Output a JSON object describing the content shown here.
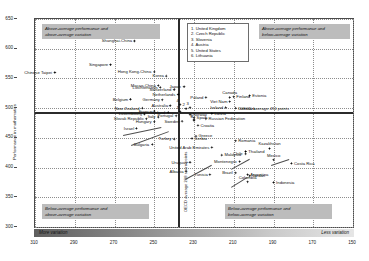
{
  "chart_data": {
    "type": "scatter",
    "title": "",
    "xlabel": "",
    "ylabel": "Performance in mathematics",
    "xlim": [
      310,
      150
    ],
    "ylim": [
      300,
      650
    ],
    "xticks": [
      310,
      290,
      270,
      250,
      230,
      210,
      190,
      170,
      150
    ],
    "yticks": [
      300,
      350,
      400,
      450,
      500,
      550,
      600,
      650
    ],
    "grid": true,
    "x_axis_reversed": true,
    "oecd_average_x": 238,
    "oecd_average_y": 494,
    "points": [
      {
        "label": "Shanghai-China",
        "x": 260,
        "y": 613
      },
      {
        "label": "Singapore",
        "x": 272,
        "y": 573
      },
      {
        "label": "Chinese Taipei",
        "x": 300,
        "y": 560
      },
      {
        "label": "Hong Kong-China",
        "x": 250,
        "y": 561
      },
      {
        "label": "Japan",
        "x": 235,
        "y": 536
      },
      {
        "label": "Macao-China",
        "x": 248,
        "y": 538
      },
      {
        "label": "Korea",
        "x": 244,
        "y": 554
      },
      {
        "label": "Switzerland",
        "x": 240,
        "y": 531
      },
      {
        "label": "Liechtenstein",
        "x": 247,
        "y": 535
      },
      {
        "label": "Netherlands",
        "x": 238,
        "y": 523
      },
      {
        "label": "Belgium",
        "x": 262,
        "y": 515
      },
      {
        "label": "Germany",
        "x": 246,
        "y": 514
      },
      {
        "label": "Australia",
        "x": 242,
        "y": 504
      },
      {
        "label": "New Zealand",
        "x": 256,
        "y": 500
      },
      {
        "label": "Poland",
        "x": 224,
        "y": 518
      },
      {
        "label": "Canada",
        "x": 212,
        "y": 518
      },
      {
        "label": "Viet Nam",
        "x": 212,
        "y": 511
      },
      {
        "label": "Finland",
        "x": 210,
        "y": 519
      },
      {
        "label": "Estonia",
        "x": 202,
        "y": 521
      },
      {
        "label": "Ireland",
        "x": 214,
        "y": 501
      },
      {
        "label": "Denmark",
        "x": 209,
        "y": 500
      },
      {
        "label": "France",
        "x": 250,
        "y": 495
      },
      {
        "label": "Slovak Republic",
        "x": 254,
        "y": 482
      },
      {
        "label": "Israel",
        "x": 259,
        "y": 466
      },
      {
        "label": "Luxembourg",
        "x": 255,
        "y": 490
      },
      {
        "label": "Portugal",
        "x": 239,
        "y": 487
      },
      {
        "label": "Italy",
        "x": 248,
        "y": 485
      },
      {
        "label": "Hungary",
        "x": 250,
        "y": 477
      },
      {
        "label": "Iceland",
        "x": 243,
        "y": 493
      },
      {
        "label": "Spain",
        "x": 230,
        "y": 484
      },
      {
        "label": "Latvia",
        "x": 221,
        "y": 491
      },
      {
        "label": "Russian Federation",
        "x": 224,
        "y": 482
      },
      {
        "label": "Norway",
        "x": 232,
        "y": 489
      },
      {
        "label": "Croatia",
        "x": 228,
        "y": 471
      },
      {
        "label": "Sweden",
        "x": 236,
        "y": 478
      },
      {
        "label": "Greece",
        "x": 229,
        "y": 453
      },
      {
        "label": "Turkey",
        "x": 240,
        "y": 448
      },
      {
        "label": "Serbia",
        "x": 231,
        "y": 449
      },
      {
        "label": "Bulgaria",
        "x": 251,
        "y": 439
      },
      {
        "label": "Romania",
        "x": 209,
        "y": 445
      },
      {
        "label": "Malaysia",
        "x": 216,
        "y": 421
      },
      {
        "label": "Thailand",
        "x": 204,
        "y": 427
      },
      {
        "label": "Chile",
        "x": 204,
        "y": 423
      },
      {
        "label": "Montenegro",
        "x": 207,
        "y": 410
      },
      {
        "label": "Kazakhstan",
        "x": 192,
        "y": 432
      },
      {
        "label": "Mexico",
        "x": 190,
        "y": 413
      },
      {
        "label": "Costa Rica",
        "x": 181,
        "y": 407
      },
      {
        "label": "Brazil",
        "x": 209,
        "y": 391
      },
      {
        "label": "Argentina",
        "x": 203,
        "y": 388
      },
      {
        "label": "Jordan",
        "x": 202,
        "y": 386
      },
      {
        "label": "Uruguay",
        "x": 232,
        "y": 409
      },
      {
        "label": "Albania",
        "x": 234,
        "y": 394
      },
      {
        "label": "United Arab Emirates",
        "x": 221,
        "y": 434
      },
      {
        "label": "Tunisia",
        "x": 222,
        "y": 388
      },
      {
        "label": "Colombia",
        "x": 203,
        "y": 376
      },
      {
        "label": "Indonesia",
        "x": 190,
        "y": 375
      }
    ],
    "numbered_points": [
      {
        "n": "1",
        "label": "United Kingdom",
        "x": 237,
        "y": 494
      },
      {
        "n": "2",
        "label": "Czech Republic",
        "x": 234,
        "y": 499
      },
      {
        "n": "3",
        "label": "Slovenia",
        "x": 232,
        "y": 501
      },
      {
        "n": "4",
        "label": "Austria",
        "x": 237,
        "y": 506
      },
      {
        "n": "5",
        "label": "United States",
        "x": 230,
        "y": 481
      },
      {
        "n": "6",
        "label": "Lithuania",
        "x": 230,
        "y": 479
      }
    ]
  },
  "axes": {
    "y_title": "Performance in mathematics",
    "y_ticks": [
      "650",
      "600",
      "550",
      "500",
      "450",
      "400",
      "350",
      "300"
    ],
    "x_ticks": [
      "310",
      "290",
      "270",
      "250",
      "230",
      "210",
      "190",
      "170",
      "150"
    ],
    "band_left_label": "More variation",
    "band_right_label": "Less variation",
    "oecd_average_vertical": "OECD average 238 score points",
    "oecd_average_horizontal": "OECD average 494 points"
  },
  "quadrants": {
    "top_left": "Above-average performance and\nabove-average variation",
    "top_right": "Above-average performance and\nbelow-average variation",
    "bottom_left": "Below-average performance and\nabove-average variation",
    "bottom_right": "Below-average performance and\nbelow-average variation"
  },
  "legend": {
    "entries": "1. United Kingdom\n2. Czech Republic\n3. Slovenia\n4. Austria\n5. United States\n6. Lithuania"
  },
  "colors": {
    "marker": "#000000",
    "quadrant_box": "#bcbcbc",
    "average_line": "#2b2b2b",
    "grid": "#8d8d8d"
  }
}
